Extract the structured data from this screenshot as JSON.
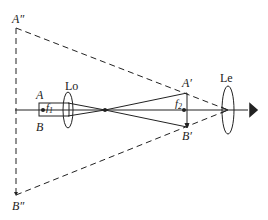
{
  "diagram": {
    "labels": {
      "A_double_prime": "A″",
      "B_double_prime": "B″",
      "A": "A",
      "B": "B",
      "objective": "Lo",
      "eyepiece": "Le",
      "A_prime": "A′",
      "B_prime": "B′",
      "f1": "f",
      "f1_sub": "1",
      "f2": "f",
      "f2_sub": "2"
    },
    "colors": {
      "line": "#222222",
      "background": "#ffffff"
    }
  }
}
